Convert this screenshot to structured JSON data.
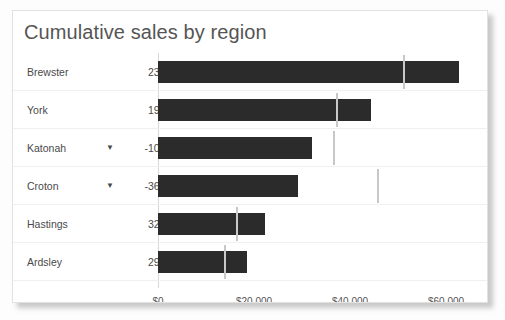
{
  "card": {
    "title": "Cumulative sales by region"
  },
  "chart_data": {
    "type": "bar",
    "orientation": "horizontal",
    "title": "Cumulative sales by region",
    "xlabel": "",
    "ylabel": "",
    "xlim": [
      0,
      66000
    ],
    "grid": false,
    "legend": null,
    "bar_color": "#2b2b2b",
    "marker_color": "#c8c8c8",
    "tick_values": [
      0,
      20000,
      40000,
      60000
    ],
    "tick_labels": [
      "$0",
      "$20,000",
      "$40,000",
      "$60,000"
    ],
    "categories": [
      "Brewster",
      "York",
      "Katonah",
      "Croton",
      "Hastings",
      "Ardsley"
    ],
    "values": [
      62700,
      44400,
      32000,
      29200,
      22300,
      18500
    ],
    "reference_values": [
      51000,
      37000,
      36500,
      45600,
      16200,
      13700
    ],
    "delta_labels": [
      "23%",
      "19%",
      "-10%",
      "-36%",
      "32%",
      "29%"
    ],
    "rows": [
      {
        "label": "Brewster",
        "delta": "23%",
        "negative": false,
        "icon": "",
        "value": 62700,
        "reference": 51000
      },
      {
        "label": "York",
        "delta": "19%",
        "negative": false,
        "icon": "",
        "value": 44400,
        "reference": 37000
      },
      {
        "label": "Katonah",
        "delta": "-10%",
        "negative": true,
        "icon": "▼",
        "value": 32000,
        "reference": 36500
      },
      {
        "label": "Croton",
        "delta": "-36%",
        "negative": true,
        "icon": "▼",
        "value": 29200,
        "reference": 45600
      },
      {
        "label": "Hastings",
        "delta": "32%",
        "negative": false,
        "icon": "",
        "value": 22300,
        "reference": 16200
      },
      {
        "label": "Ardsley",
        "delta": "29%",
        "negative": false,
        "icon": "",
        "value": 18500,
        "reference": 13700
      }
    ]
  }
}
